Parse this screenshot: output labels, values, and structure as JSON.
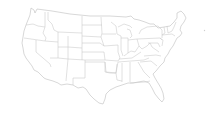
{
  "map": {
    "type": "blank-outline",
    "region": "United States (contiguous)",
    "style": {
      "background": "#ffffff",
      "border_color": "#c8c8c8"
    },
    "labels": []
  }
}
